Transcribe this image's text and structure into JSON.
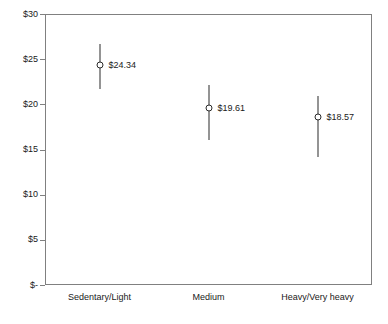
{
  "chart_data": {
    "type": "scatter",
    "title": "",
    "subtitle": "",
    "xlabel": "",
    "ylabel": "",
    "grid": false,
    "legend": "none",
    "categories": [
      "Sedentary/Light",
      "Medium",
      "Heavy/Very heavy"
    ],
    "ylim": [
      0,
      30
    ],
    "yticks": [
      0,
      5,
      10,
      15,
      20,
      25,
      30
    ],
    "ytick_labels": [
      "$-",
      "$5",
      "$10",
      "$15",
      "$20",
      "$25",
      "$30"
    ],
    "series": [
      {
        "name": "Mean with confidence interval",
        "values": [
          24.34,
          19.61,
          18.57
        ],
        "labels": [
          "$24.34",
          "$19.61",
          "$18.57"
        ],
        "lower": [
          21.7,
          16.05,
          14.17
        ],
        "upper": [
          26.7,
          22.14,
          20.91
        ]
      }
    ],
    "points": [
      {
        "category": "Sedentary/Light",
        "value": 24.34,
        "label": "$24.34",
        "lower": 21.7,
        "upper": 26.7
      },
      {
        "category": "Medium",
        "value": 19.61,
        "label": "$19.61",
        "lower": 16.05,
        "upper": 22.14
      },
      {
        "category": "Heavy/Very heavy",
        "value": 18.57,
        "label": "$18.57",
        "lower": 14.17,
        "upper": 20.91
      }
    ],
    "colors": {
      "marker_stroke": "#2b2b2b",
      "marker_fill": "#ffffff",
      "whisker": "#2b2b2b",
      "axis": "#808080",
      "text": "#1a1a1a",
      "background": "#ffffff"
    }
  }
}
